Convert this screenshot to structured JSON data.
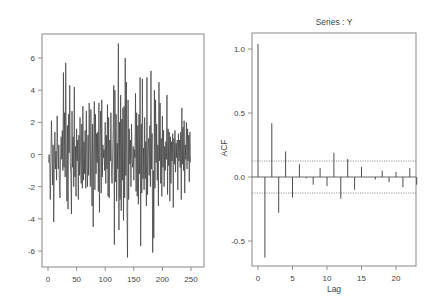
{
  "chart_data": [
    {
      "type": "line",
      "title": "",
      "xlabel": "",
      "ylabel": "",
      "xlim": [
        -5,
        270
      ],
      "ylim": [
        -7,
        7.5
      ],
      "x_ticks": [
        0,
        50,
        100,
        150,
        200,
        250
      ],
      "y_ticks": [
        -6,
        -4,
        -2,
        0,
        2,
        4,
        6
      ],
      "grid": false,
      "legend": null,
      "series": [
        {
          "name": "Y",
          "color": "#3a3a3a",
          "values": [
            -0.5,
            0.0,
            -0.6,
            -2.8,
            -0.4,
            2.1,
            0.4,
            -1.9,
            0.6,
            -4.2,
            -0.6,
            1.4,
            -0.9,
            0.2,
            -1.6,
            2.4,
            0.3,
            -0.9,
            0.6,
            -2.0,
            -2.7,
            0.0,
            1.1,
            -0.3,
            1.5,
            -1.0,
            5.1,
            -0.8,
            2.6,
            -1.4,
            5.7,
            0.3,
            -2.9,
            1.8,
            -3.4,
            2.5,
            0.1,
            4.3,
            -0.5,
            -1.3,
            -3.7,
            2.7,
            -0.8,
            1.1,
            -2.0,
            4.2,
            -1.4,
            0.5,
            -2.6,
            1.6,
            -0.4,
            0.9,
            -2.8,
            1.2,
            -1.3,
            2.3,
            -0.6,
            -1.8,
            1.9,
            -2.1,
            3.0,
            -1.6,
            0.8,
            -1.2,
            1.5,
            -2.1,
            2.7,
            -0.7,
            -2.0,
            1.2,
            -1.3,
            3.2,
            0.2,
            -2.0,
            2.8,
            -0.9,
            -3.2,
            1.9,
            -4.5,
            0.8,
            3.3,
            -2.2,
            2.5,
            -1.2,
            1.3,
            -0.5,
            1.4,
            -2.3,
            3.2,
            -3.6,
            1.1,
            2.7,
            -2.4,
            3.4,
            -1.4,
            0.6,
            -0.2,
            0.3,
            -1.0,
            2.0,
            -1.8,
            1.2,
            -0.9,
            3.1,
            -2.6,
            2.3,
            -2.7,
            0.9,
            -0.4,
            2.6,
            -1.1,
            -1.8,
            -0.1,
            1.6,
            4.3,
            -5.6,
            4.0,
            -1.7,
            2.5,
            -2.9,
            0.7,
            -0.9,
            6.9,
            -4.7,
            2.0,
            -2.8,
            3.7,
            -3.5,
            2.2,
            -1.6,
            2.9,
            -4.1,
            3.0,
            -2.7,
            6.0,
            -1.3,
            4.5,
            -3.1,
            -6.4,
            3.4,
            -2.8,
            1.6,
            -0.6,
            0.9,
            -2.0,
            1.9,
            -0.3,
            -0.8,
            0.5,
            -1.6,
            0.3,
            -0.2,
            3.8,
            -2.3,
            2.6,
            -2.6,
            1.8,
            -3.1,
            2.5,
            -1.2,
            4.8,
            -5.7,
            1.9,
            -2.4,
            4.7,
            -1.5,
            0.4,
            -2.2,
            2.3,
            -1.5,
            0.8,
            -3.2,
            4.8,
            -2.5,
            0.4,
            1.0,
            -1.3,
            1.8,
            -2.0,
            5.2,
            -0.9,
            1.3,
            -6.1,
            -1.0,
            -5.2,
            4.0,
            -2.1,
            3.4,
            -0.5,
            1.9,
            -1.6,
            0.6,
            -3.2,
            4.5,
            -0.4,
            3.2,
            -1.8,
            1.0,
            -2.6,
            2.4,
            -0.8,
            1.5,
            -2.0,
            0.5,
            -1.0,
            0.8,
            -0.3,
            3.7,
            -2.5,
            1.6,
            -0.7,
            1.4,
            -2.9,
            1.1,
            -1.8,
            0.8,
            -0.4,
            1.3,
            -3.3,
            1.0,
            -0.6,
            1.5,
            -1.1,
            0.7,
            -0.2,
            0.9,
            -2.2,
            1.3,
            -0.4,
            0.9,
            -0.8,
            1.4,
            -2.8,
            2.9,
            -0.6,
            1.7,
            -1.0,
            2.1,
            -2.4,
            0.6,
            -0.3,
            2.0,
            -0.9,
            1.6,
            -0.4,
            1.2,
            -1.7,
            1.4,
            -0.5
          ]
        }
      ]
    },
    {
      "type": "bar",
      "title": "Series : Y",
      "xlabel": "Lag",
      "ylabel": "ACF",
      "xlim": [
        -1,
        23
      ],
      "ylim": [
        -0.7,
        1.1
      ],
      "x_ticks": [
        0,
        5,
        10,
        15,
        20
      ],
      "y_ticks": [
        -0.5,
        0.0,
        0.5,
        1.0
      ],
      "y_tick_labels": [
        "-0.5",
        "0.0",
        "0.5",
        "1.0"
      ],
      "grid": false,
      "legend": null,
      "confidence_bounds": [
        0.125,
        -0.125
      ],
      "categories": [
        0,
        1,
        2,
        3,
        4,
        5,
        6,
        7,
        8,
        9,
        10,
        11,
        12,
        13,
        14,
        15,
        16,
        17,
        18,
        19,
        20,
        21,
        22,
        23
      ],
      "values": [
        1.04,
        -0.63,
        0.42,
        -0.28,
        0.2,
        -0.16,
        0.1,
        -0.01,
        -0.06,
        0.07,
        -0.07,
        0.19,
        -0.17,
        0.14,
        -0.1,
        0.08,
        0.0,
        -0.02,
        0.05,
        -0.04,
        0.04,
        -0.08,
        0.07,
        -0.06
      ]
    }
  ],
  "left_plot": {
    "x_tick_labels": [
      "0",
      "50",
      "100",
      "150",
      "200",
      "250"
    ],
    "y_tick_labels": [
      "-6",
      "-4",
      "-2",
      "0",
      "2",
      "4",
      "6"
    ]
  },
  "right_plot": {
    "title": "Series : Y",
    "xlabel": "Lag",
    "ylabel": "ACF",
    "x_tick_labels": [
      "0",
      "5",
      "10",
      "15",
      "20"
    ],
    "y_tick_labels": [
      "-0.5",
      "0.0",
      "0.5",
      "1.0"
    ]
  },
  "colors": {
    "line": "#3a3a3a",
    "axis": "#777777",
    "bound": "#555555",
    "text": "#444444"
  }
}
